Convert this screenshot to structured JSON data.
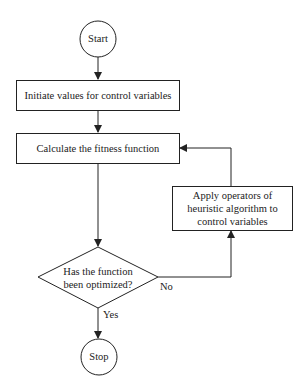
{
  "diagram": {
    "type": "flowchart",
    "colors": {
      "stroke": "#222222",
      "fill": "#ffffff",
      "text": "#222222"
    },
    "nodes": {
      "start": {
        "shape": "circle",
        "label": "Start"
      },
      "init": {
        "shape": "rectangle",
        "label": "Initiate values for control variables"
      },
      "fitness": {
        "shape": "rectangle",
        "label": "Calculate the fitness function"
      },
      "decision": {
        "shape": "diamond",
        "label_line1": "Has the function",
        "label_line2": "been optimized?"
      },
      "apply": {
        "shape": "rectangle",
        "label_line1": "Apply operators of",
        "label_line2": "heuristic algorithm to",
        "label_line3": "control variables"
      },
      "stop": {
        "shape": "circle",
        "label": "Stop"
      }
    },
    "edges": [
      {
        "from": "start",
        "to": "init",
        "label": ""
      },
      {
        "from": "init",
        "to": "fitness",
        "label": ""
      },
      {
        "from": "fitness",
        "to": "decision",
        "label": ""
      },
      {
        "from": "decision",
        "to": "stop",
        "label": "Yes"
      },
      {
        "from": "decision",
        "to": "apply",
        "label": "No"
      },
      {
        "from": "apply",
        "to": "fitness",
        "label": ""
      }
    ],
    "edge_labels": {
      "yes": "Yes",
      "no": "No"
    }
  }
}
